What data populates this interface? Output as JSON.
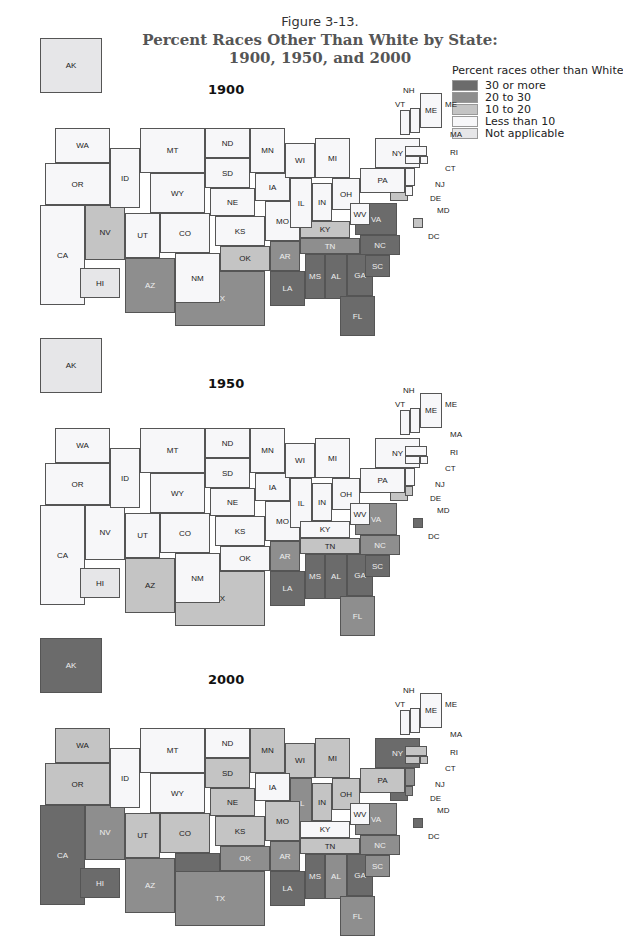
{
  "figure": {
    "number": "Figure 3-13.",
    "title_line1": "Percent Races Other Than White by State:",
    "title_line2": "1900, 1950, and 2000"
  },
  "legend": {
    "title": "Percent races other than White",
    "items": [
      {
        "key": "c30",
        "label": "30 or more",
        "color": "#6b6b6b"
      },
      {
        "key": "c20",
        "label": "20 to 30",
        "color": "#8e8e8e"
      },
      {
        "key": "c10",
        "label": "10 to 20",
        "color": "#c4c4c4"
      },
      {
        "key": "c0",
        "label": "Less than 10",
        "color": "#f7f7f9"
      },
      {
        "key": "na",
        "label": "Not applicable",
        "color": "#e6e6e8"
      }
    ]
  },
  "maps": [
    {
      "year": "1900"
    },
    {
      "year": "1950"
    },
    {
      "year": "2000"
    }
  ],
  "chart_data": {
    "type": "choropleth",
    "title": "Percent Races Other Than White by State: 1900, 1950, and 2000",
    "legend_position": "top-right",
    "classes": [
      "30 or more",
      "20 to 30",
      "10 to 20",
      "Less than 10",
      "Not applicable"
    ],
    "1900": {
      "30 or more": [
        "LA",
        "MS",
        "AL",
        "GA",
        "SC",
        "NC",
        "VA",
        "FL"
      ],
      "20 to 30": [
        "AZ",
        "TX",
        "AR",
        "TN"
      ],
      "10 to 20": [
        "NV",
        "OK",
        "KY",
        "MD",
        "DC"
      ],
      "Less than 10": [
        "WA",
        "OR",
        "CA",
        "ID",
        "MT",
        "WY",
        "UT",
        "CO",
        "NM",
        "ND",
        "SD",
        "NE",
        "KS",
        "MN",
        "IA",
        "MO",
        "WI",
        "IL",
        "MI",
        "IN",
        "OH",
        "WV",
        "PA",
        "NY",
        "VT",
        "NH",
        "ME",
        "MA",
        "RI",
        "CT",
        "NJ",
        "DE"
      ],
      "Not applicable": [
        "AK",
        "HI"
      ]
    },
    "1950": {
      "30 or more": [
        "LA",
        "MS",
        "AL",
        "GA",
        "SC",
        "DC"
      ],
      "20 to 30": [
        "AR",
        "NC",
        "VA",
        "FL"
      ],
      "10 to 20": [
        "AZ",
        "TX",
        "TN",
        "MD",
        "DE"
      ],
      "Less than 10": [
        "WA",
        "OR",
        "CA",
        "NV",
        "ID",
        "MT",
        "WY",
        "UT",
        "CO",
        "NM",
        "ND",
        "SD",
        "NE",
        "KS",
        "OK",
        "MN",
        "IA",
        "MO",
        "WI",
        "IL",
        "MI",
        "IN",
        "OH",
        "KY",
        "WV",
        "PA",
        "NY",
        "VT",
        "NH",
        "ME",
        "MA",
        "RI",
        "CT",
        "NJ"
      ],
      "Not applicable": [
        "AK",
        "HI"
      ]
    },
    "2000": {
      "30 or more": [
        "CA",
        "HI",
        "AK",
        "NM",
        "MS",
        "LA",
        "GA",
        "MD",
        "NY",
        "DC"
      ],
      "20 to 30": [
        "NV",
        "AZ",
        "TX",
        "OK",
        "AR",
        "IL",
        "AL",
        "SC",
        "NC",
        "VA",
        "FL",
        "NJ",
        "DE"
      ],
      "10 to 20": [
        "WA",
        "OR",
        "UT",
        "CO",
        "SD",
        "NE",
        "KS",
        "MN",
        "MO",
        "WI",
        "MI",
        "IN",
        "OH",
        "TN",
        "PA",
        "MA",
        "RI",
        "CT"
      ],
      "Less than 10": [
        "ID",
        "MT",
        "WY",
        "ND",
        "IA",
        "KY",
        "WV",
        "VT",
        "NH",
        "ME"
      ]
    }
  }
}
